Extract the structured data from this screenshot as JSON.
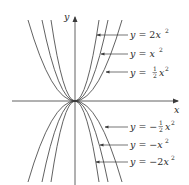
{
  "diagram": {
    "title": "",
    "axes": {
      "x_label": "x",
      "y_label": "y",
      "origin_px": [
        75,
        101
      ]
    },
    "colors": {
      "line": "#3a3a3a",
      "text": "#2a2a2a",
      "background": "#ffffff"
    },
    "curves": [
      {
        "id": "2x2",
        "equation": "y = 2x^2",
        "k": 2,
        "half_width_px": 24
      },
      {
        "id": "x2",
        "equation": "y = x^2",
        "k": 1,
        "half_width_px": 33
      },
      {
        "id": "half_x2",
        "equation": "y = 1/2 x^2",
        "k": 0.5,
        "half_width_px": 47
      },
      {
        "id": "neg_half_x2",
        "equation": "y = -1/2 x^2",
        "k": -0.5,
        "half_width_px": 47
      },
      {
        "id": "neg_x2",
        "equation": "y = -x^2",
        "k": -1,
        "half_width_px": 33
      },
      {
        "id": "neg_2x2",
        "equation": "y = -2x^2",
        "k": -2,
        "half_width_px": 24
      }
    ],
    "labels": {
      "l1": {
        "y": "y",
        "eq": " = 2",
        "var": "x",
        "exp": "2"
      },
      "l2": {
        "y": "y",
        "eq": " = ",
        "var": "x",
        "exp": "2"
      },
      "l3": {
        "y": "y",
        "eq": " = ",
        "frac_num": "1",
        "frac_den": "2",
        "var": "x",
        "exp": "2"
      },
      "l4": {
        "y": "y",
        "eq": " = −",
        "frac_num": "1",
        "frac_den": "2",
        "var": "x",
        "exp": "2"
      },
      "l5": {
        "y": "y",
        "eq": " = −",
        "var": "x",
        "exp": "2"
      },
      "l6": {
        "y": "y",
        "eq": " = −2",
        "var": "x",
        "exp": "2"
      }
    }
  }
}
